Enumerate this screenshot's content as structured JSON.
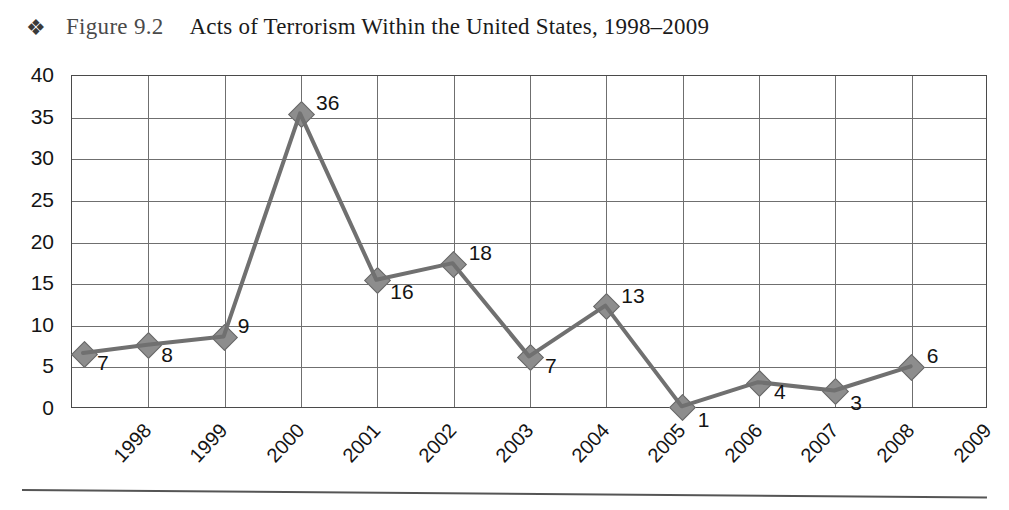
{
  "caption": {
    "bullet_icon": "four-diamond-bullet-icon",
    "bullet_glyph": "❖",
    "figure_number": "Figure 9.2",
    "title": "Acts of Terrorism Within the United States, 1998–2009"
  },
  "chart_data": {
    "type": "line",
    "title": "Acts of Terrorism Within the United States, 1998–2009",
    "xlabel": "",
    "ylabel": "",
    "categories": [
      "1998",
      "1999",
      "2000",
      "2001",
      "2002",
      "2003",
      "2004",
      "2005",
      "2006",
      "2007",
      "2008",
      "2009"
    ],
    "values": [
      7,
      8,
      9,
      36,
      16,
      18,
      7,
      13,
      1,
      4,
      3,
      6
    ],
    "data_labels": [
      "7",
      "8",
      "9",
      "36",
      "16",
      "18",
      "7",
      "13",
      "1",
      "4",
      "3",
      "6"
    ],
    "ylim": [
      0,
      40
    ],
    "yticks": [
      0,
      5,
      10,
      15,
      20,
      25,
      30,
      35,
      40
    ],
    "ytick_labels": [
      "0",
      "5",
      "10",
      "15",
      "20",
      "25",
      "30",
      "35",
      "40"
    ],
    "grid": true,
    "legend": "none",
    "marker": "diamond",
    "line_color": "#707070",
    "marker_color": "#8d8d8d",
    "plotted_points": [
      6.6,
      7.6,
      8.6,
      35.4,
      15.4,
      17.4,
      6.2,
      12.3,
      0.2,
      3.1,
      2.1,
      5.0
    ]
  },
  "colors": {
    "line": "#707070",
    "marker_fill": "#8d8d8d",
    "marker_stroke": "#6a6a6a",
    "grid": "#6f6f6f",
    "frame": "#4a4a4a",
    "text": "#141414"
  }
}
